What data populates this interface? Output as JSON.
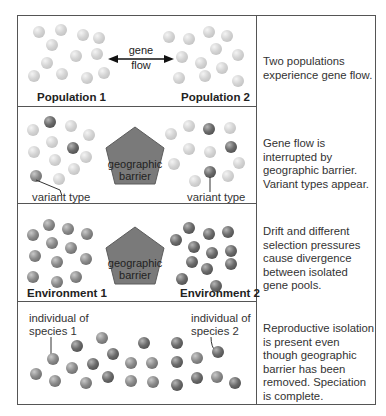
{
  "diagram": {
    "rows": [
      {
        "left_label": "Population 1",
        "right_label": "Population 2",
        "arrow_label_line1": "gene",
        "arrow_label_line2": "flow",
        "description": "Two populations experience gene flow."
      },
      {
        "barrier_line1": "geographic",
        "barrier_line2": "barrier",
        "left_callout": "variant type",
        "right_callout": "variant type",
        "description": "Gene flow is interrupted by geographic barrier. Variant types appear."
      },
      {
        "left_label": "Environment 1",
        "right_label": "Environment 2",
        "barrier_line1": "geographic",
        "barrier_line2": "barrier",
        "description": "Drift and different selection pressures cause divergence between isolated gene pools."
      },
      {
        "left_callout_line1": "individual of",
        "left_callout_line2": "species 1",
        "right_callout_line1": "individual of",
        "right_callout_line2": "species 2",
        "description": "Reproductive isolation is present even though geographic barrier has been removed. Speciation is complete."
      }
    ],
    "colors": {
      "border": "#555555",
      "barrier_fill": "#7a7a7a",
      "light_ball": "#d4d4d4",
      "dark_ball": "#5a5a5a"
    }
  }
}
